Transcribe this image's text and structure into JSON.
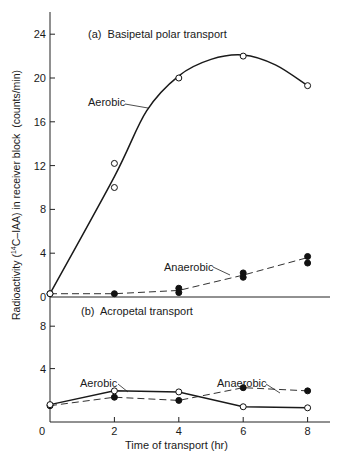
{
  "chart_data": [
    {
      "type": "line",
      "title": "(a) Basipetal polar transport",
      "xlabel": "Time of transport (hr)",
      "ylabel": "Radioactivity (14C-IAA) in receiver block (counts/min)",
      "ylim": [
        0,
        26
      ],
      "yticks": [
        0,
        4,
        8,
        12,
        16,
        20,
        24
      ],
      "xticks": [
        0,
        2,
        4,
        6,
        8
      ],
      "grid": false,
      "series": [
        {
          "name": "Aerobic",
          "marker": "open-circle",
          "line": "solid-smooth",
          "points": [
            [
              0,
              0.3
            ],
            [
              2,
              12.2
            ],
            [
              2,
              10.0
            ],
            [
              4,
              20.0
            ],
            [
              6,
              22.0
            ],
            [
              8,
              19.3
            ]
          ],
          "curve": [
            [
              0,
              0.3
            ],
            [
              2,
              11.0
            ],
            [
              3,
              17.0
            ],
            [
              4,
              20.2
            ],
            [
              5,
              21.7
            ],
            [
              6,
              22.1
            ],
            [
              7,
              21.2
            ],
            [
              8,
              19.3
            ]
          ]
        },
        {
          "name": "Anaerobic",
          "marker": "filled-circle",
          "line": "dashed",
          "points": [
            [
              0,
              0.3
            ],
            [
              2,
              0.3
            ],
            [
              4,
              0.8
            ],
            [
              4,
              0.4
            ],
            [
              6,
              2.2
            ],
            [
              6,
              1.8
            ],
            [
              8,
              3.7
            ],
            [
              8,
              3.1
            ]
          ],
          "curve": [
            [
              0,
              0.3
            ],
            [
              2,
              0.3
            ],
            [
              4,
              0.6
            ],
            [
              6,
              2.0
            ],
            [
              8,
              3.6
            ]
          ]
        }
      ]
    },
    {
      "type": "line",
      "title": "(b) Acropetal transport",
      "xlabel": "Time of transport (hr)",
      "ylabel": "Radioactivity (14C-IAA) in receiver block (counts/min)",
      "ylim": [
        0,
        10
      ],
      "yticks": [
        4,
        8
      ],
      "xticks": [
        0,
        2,
        4,
        6,
        8
      ],
      "grid": false,
      "series": [
        {
          "name": "Aerobic",
          "marker": "open-circle",
          "line": "solid",
          "points": [
            [
              0,
              0.6
            ],
            [
              2,
              1.9
            ],
            [
              4,
              1.8
            ],
            [
              6,
              0.4
            ],
            [
              8,
              0.3
            ]
          ]
        },
        {
          "name": "Anaerobic",
          "marker": "filled-circle",
          "line": "dashed",
          "points": [
            [
              0,
              0.5
            ],
            [
              2,
              1.3
            ],
            [
              4,
              1.0
            ],
            [
              6,
              2.2
            ],
            [
              8,
              1.9
            ]
          ]
        }
      ]
    }
  ],
  "labels": {
    "panel_a_title": "(a)  Basipetal polar transport",
    "panel_b_title": "(b)  Acropetal transport",
    "aerobic_a": "Aerobic",
    "anaerobic_a": "Anaerobic",
    "aerobic_b": "Aerobic",
    "anaerobic_b": "Anaerobic",
    "xlabel": "Time of transport (hr)",
    "ylabel_pre": "Radioactivity (",
    "ylabel_sup": "14",
    "ylabel_post": "C–IAA) in receiver block  (counts/min)",
    "yticks_a": [
      "0",
      "4",
      "8",
      "12",
      "16",
      "20",
      "24"
    ],
    "yticks_b": [
      "4",
      "8"
    ],
    "xticks": [
      "0",
      "2",
      "4",
      "6",
      "8"
    ]
  }
}
